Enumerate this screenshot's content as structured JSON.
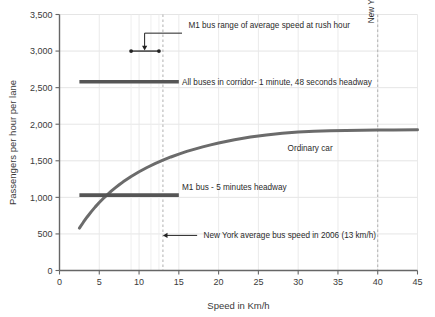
{
  "chart_data": {
    "type": "line",
    "title": "",
    "xlabel": "Speed in Km/h",
    "ylabel": "Passengers per hour per lane",
    "xlim": [
      0,
      45
    ],
    "ylim": [
      0,
      3500
    ],
    "xticks": [
      0,
      5,
      10,
      15,
      20,
      25,
      30,
      35,
      40,
      45
    ],
    "xtick_labels": [
      "0",
      "5",
      "10",
      "15",
      "20",
      "25",
      "30",
      "35",
      "40",
      "45"
    ],
    "yticks": [
      0,
      500,
      1000,
      1500,
      2000,
      2500,
      3000,
      3500
    ],
    "ytick_labels": [
      "0",
      "500",
      "1,000",
      "1,500",
      "2,000",
      "2,500",
      "3,000",
      "3,500"
    ],
    "grid": true,
    "legend_position": "inline-labels",
    "series": [
      {
        "name": "Ordinary car",
        "type": "line",
        "label": "Ordinary car",
        "label_x": 31.5,
        "label_y": 1640,
        "color": "#6b6b6b",
        "width": 3.0,
        "points": [
          [
            2.5,
            580
          ],
          [
            3.0,
            660
          ],
          [
            3.5,
            735
          ],
          [
            4.0,
            805
          ],
          [
            4.5,
            870
          ],
          [
            5.0,
            930
          ],
          [
            5.5,
            985
          ],
          [
            6.0,
            1035
          ],
          [
            6.5,
            1085
          ],
          [
            7.0,
            1130
          ],
          [
            7.5,
            1172
          ],
          [
            8.0,
            1212
          ],
          [
            9.0,
            1285
          ],
          [
            10.0,
            1350
          ],
          [
            11.0,
            1408
          ],
          [
            12.0,
            1460
          ],
          [
            13.0,
            1508
          ],
          [
            14.0,
            1552
          ],
          [
            15.0,
            1592
          ],
          [
            16.0,
            1628
          ],
          [
            17.0,
            1660
          ],
          [
            18.0,
            1690
          ],
          [
            19.0,
            1718
          ],
          [
            20.0,
            1744
          ],
          [
            22.0,
            1788
          ],
          [
            24.0,
            1824
          ],
          [
            26.0,
            1853
          ],
          [
            28.0,
            1876
          ],
          [
            30.0,
            1894
          ],
          [
            32.0,
            1905
          ],
          [
            34.0,
            1911
          ],
          [
            36.0,
            1915
          ],
          [
            38.0,
            1918
          ],
          [
            40.0,
            1920
          ],
          [
            42.0,
            1922
          ],
          [
            45.0,
            1925
          ]
        ]
      },
      {
        "name": "All buses in corridor",
        "type": "hline",
        "label": "All buses in corridor- 1 minute, 48 seconds headway",
        "y": 2580,
        "x_start": 2.5,
        "x_end": 15.0,
        "label_x": 15.4,
        "label_y": 2580,
        "color": "#555555",
        "width": 3.6
      },
      {
        "name": "M1 bus - 5 minutes headway",
        "type": "hline",
        "label": "M1 bus - 5 minutes headway",
        "y": 1030,
        "x_start": 2.5,
        "x_end": 15.0,
        "label_x": 15.4,
        "label_y": 1135,
        "color": "#555555",
        "width": 3.6
      }
    ],
    "annotations": [
      {
        "name": "m1-bus-range-rush-hour",
        "text": "M1 bus range of average speed at rush hour",
        "type": "range-bar-with-leader",
        "bar_y": 3000,
        "bar_x_start": 9.0,
        "bar_x_end": 12.5,
        "leader_from_x": 10.7,
        "leader_elbow_y": 3245,
        "leader_to_x": 15.4,
        "text_x": 16.2,
        "text_y": 3310,
        "color": "#222222"
      },
      {
        "name": "new-york-average-bus-speed-2006",
        "text": "New York average bus speed in 2006 (13 km/h)",
        "type": "arrow-left",
        "y": 480,
        "arrow_tip_x": 13.0,
        "arrow_tail_x": 17.3,
        "text_x": 18.1,
        "color": "#222222"
      }
    ],
    "vlines": [
      {
        "name": "new-york-average-bus-speed-line",
        "x": 13.0,
        "style": "dashed",
        "color": "#b0b0b0",
        "label": ""
      },
      {
        "name": "new-york-speed-limit-line",
        "x": 40.0,
        "style": "dashed",
        "color": "#b0b0b0",
        "label": "New York speed limit",
        "label_rotated": true,
        "label_y": 3380
      }
    ],
    "extra_gridlines_x": [
      9.0,
      11.5,
      12.5
    ]
  }
}
